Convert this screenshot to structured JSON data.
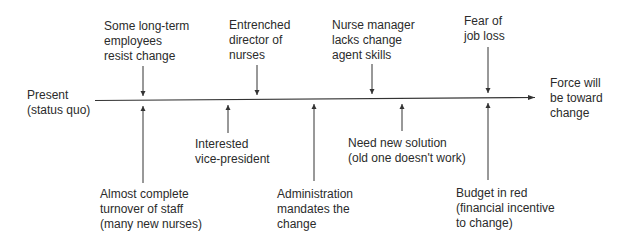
{
  "diagram": {
    "type": "force-field-analysis",
    "start_label": [
      "Present",
      "(status quo)"
    ],
    "end_label": [
      "Force will",
      "be toward",
      "change"
    ],
    "restraining_forces": [
      {
        "lines": [
          "Some long-term",
          "employees",
          "resist change"
        ],
        "x": 143
      },
      {
        "lines": [
          "Entrenched",
          "director of",
          "nurses"
        ],
        "x": 257
      },
      {
        "lines": [
          "Nurse manager",
          "lacks change",
          "agent skills"
        ],
        "x": 372
      },
      {
        "lines": [
          "Fear of",
          "job loss"
        ],
        "x": 488
      }
    ],
    "driving_forces": [
      {
        "lines": [
          "Almost complete",
          "turnover of staff",
          "(many new nurses)"
        ],
        "x": 143
      },
      {
        "lines": [
          "Interested",
          "vice-president"
        ],
        "x": 228
      },
      {
        "lines": [
          "Administration",
          "mandates the",
          "change"
        ],
        "x": 314
      },
      {
        "lines": [
          "Need new solution",
          "(old one doesn't work)"
        ],
        "x": 402
      },
      {
        "lines": [
          "Budget in red",
          "(financial incentive",
          "to change)"
        ],
        "x": 488
      }
    ],
    "colors": {
      "line": "#333333",
      "text": "#2b2b2b",
      "background": "#ffffff"
    }
  }
}
